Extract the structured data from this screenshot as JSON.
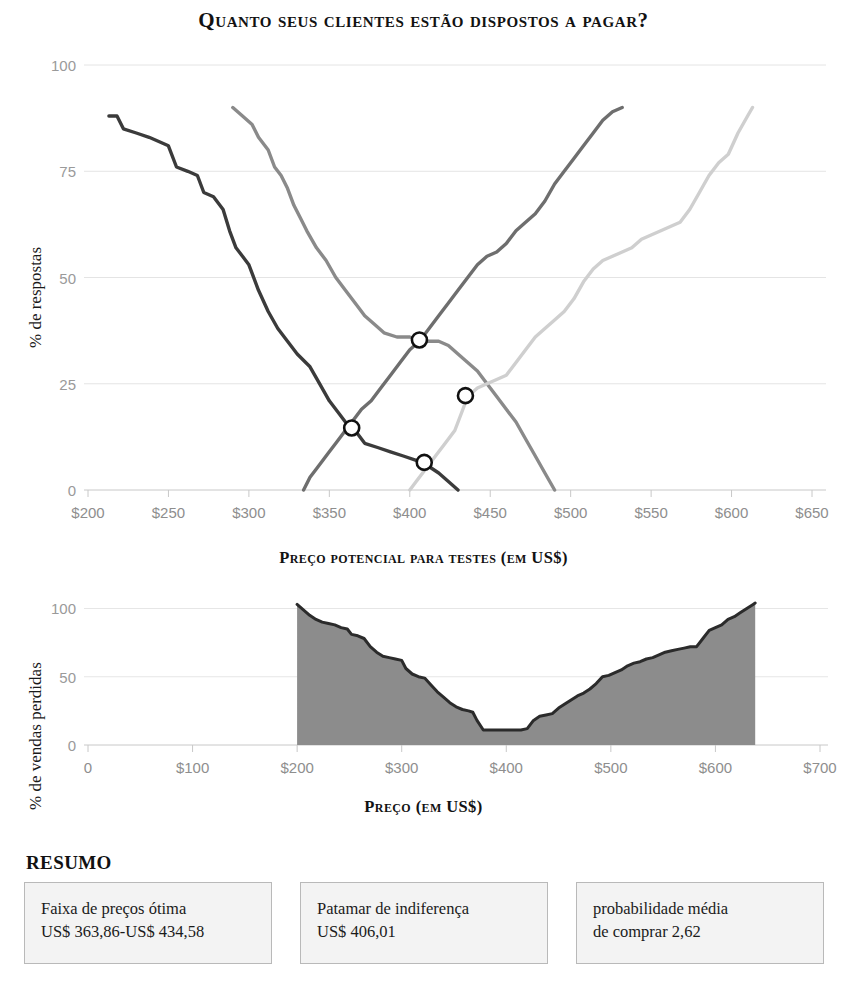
{
  "title": "Quanto seus clientes estão dispostos a pagar?",
  "chart_data": [
    {
      "type": "line",
      "title": "Quanto seus clientes estão dispostos a pagar?",
      "xlabel": "Preço potencial para testes (em US$)",
      "ylabel": "% de respostas",
      "xlim": [
        200,
        650
      ],
      "ylim": [
        0,
        100
      ],
      "xticks": [
        "$200",
        "$250",
        "$300",
        "$350",
        "$400",
        "$450",
        "$500",
        "$550",
        "$600",
        "$650"
      ],
      "xtick_values": [
        200,
        250,
        300,
        350,
        400,
        450,
        500,
        550,
        600,
        650
      ],
      "yticks": [
        "0",
        "25",
        "50",
        "75",
        "100"
      ],
      "ytick_values": [
        0,
        25,
        50,
        75,
        100
      ],
      "grid": true,
      "legend": "none",
      "series": [
        {
          "name": "muito barato (acumulado decrescente)",
          "color": "#3b3b3b",
          "points": [
            [
              213,
              88
            ],
            [
              218,
              88
            ],
            [
              222,
              85
            ],
            [
              230,
              84
            ],
            [
              238,
              83
            ],
            [
              244,
              82
            ],
            [
              250,
              81
            ],
            [
              255,
              76
            ],
            [
              262,
              75
            ],
            [
              268,
              74
            ],
            [
              272,
              70
            ],
            [
              278,
              69
            ],
            [
              284,
              66
            ],
            [
              288,
              61
            ],
            [
              292,
              57
            ],
            [
              296,
              55
            ],
            [
              300,
              53
            ],
            [
              306,
              47
            ],
            [
              312,
              42
            ],
            [
              318,
              38
            ],
            [
              324,
              35
            ],
            [
              330,
              32
            ],
            [
              338,
              29
            ],
            [
              344,
              25
            ],
            [
              350,
              21
            ],
            [
              356,
              18
            ],
            [
              362,
              15
            ],
            [
              366,
              14
            ],
            [
              372,
              11
            ],
            [
              380,
              10
            ],
            [
              388,
              9
            ],
            [
              396,
              8
            ],
            [
              404,
              7
            ],
            [
              410,
              6
            ],
            [
              418,
              4
            ],
            [
              424,
              2
            ],
            [
              430,
              0
            ]
          ]
        },
        {
          "name": "barato (acumulado decrescente)",
          "color": "#8a8a8a",
          "points": [
            [
              290,
              90
            ],
            [
              296,
              88
            ],
            [
              302,
              86
            ],
            [
              306,
              83
            ],
            [
              312,
              80
            ],
            [
              316,
              76
            ],
            [
              320,
              74
            ],
            [
              324,
              71
            ],
            [
              328,
              67
            ],
            [
              332,
              64
            ],
            [
              336,
              61
            ],
            [
              342,
              57
            ],
            [
              348,
              54
            ],
            [
              354,
              50
            ],
            [
              360,
              47
            ],
            [
              366,
              44
            ],
            [
              372,
              41
            ],
            [
              378,
              39
            ],
            [
              384,
              37
            ],
            [
              392,
              36
            ],
            [
              400,
              36
            ],
            [
              408,
              35
            ],
            [
              412,
              35
            ],
            [
              418,
              35
            ],
            [
              424,
              34
            ],
            [
              430,
              32
            ],
            [
              436,
              30
            ],
            [
              442,
              28
            ],
            [
              448,
              25
            ],
            [
              454,
              22
            ],
            [
              460,
              19
            ],
            [
              466,
              16
            ],
            [
              472,
              12
            ],
            [
              478,
              8
            ],
            [
              484,
              4
            ],
            [
              490,
              0
            ]
          ]
        },
        {
          "name": "caro (acumulado crescente)",
          "color": "#6e6e6e",
          "points": [
            [
              334,
              0
            ],
            [
              338,
              3
            ],
            [
              342,
              5
            ],
            [
              346,
              7
            ],
            [
              350,
              9
            ],
            [
              354,
              11
            ],
            [
              358,
              13
            ],
            [
              362,
              15
            ],
            [
              366,
              17
            ],
            [
              370,
              19
            ],
            [
              376,
              21
            ],
            [
              382,
              24
            ],
            [
              388,
              27
            ],
            [
              394,
              30
            ],
            [
              400,
              33
            ],
            [
              406,
              35
            ],
            [
              412,
              38
            ],
            [
              418,
              41
            ],
            [
              424,
              44
            ],
            [
              430,
              47
            ],
            [
              436,
              50
            ],
            [
              442,
              53
            ],
            [
              448,
              55
            ],
            [
              454,
              56
            ],
            [
              460,
              58
            ],
            [
              466,
              61
            ],
            [
              472,
              63
            ],
            [
              478,
              65
            ],
            [
              484,
              68
            ],
            [
              490,
              72
            ],
            [
              496,
              75
            ],
            [
              502,
              78
            ],
            [
              508,
              81
            ],
            [
              514,
              84
            ],
            [
              520,
              87
            ],
            [
              526,
              89
            ],
            [
              532,
              90
            ]
          ]
        },
        {
          "name": "muito caro (acumulado crescente)",
          "color": "#cfcfcf",
          "points": [
            [
              400,
              0
            ],
            [
              404,
              2
            ],
            [
              410,
              5
            ],
            [
              416,
              8
            ],
            [
              422,
              11
            ],
            [
              428,
              14
            ],
            [
              432,
              18
            ],
            [
              436,
              22
            ],
            [
              442,
              24
            ],
            [
              448,
              25
            ],
            [
              454,
              26
            ],
            [
              460,
              27
            ],
            [
              466,
              30
            ],
            [
              472,
              33
            ],
            [
              478,
              36
            ],
            [
              484,
              38
            ],
            [
              490,
              40
            ],
            [
              496,
              42
            ],
            [
              502,
              45
            ],
            [
              508,
              49
            ],
            [
              514,
              52
            ],
            [
              520,
              54
            ],
            [
              526,
              55
            ],
            [
              532,
              56
            ],
            [
              538,
              57
            ],
            [
              544,
              59
            ],
            [
              550,
              60
            ],
            [
              556,
              61
            ],
            [
              562,
              62
            ],
            [
              568,
              63
            ],
            [
              574,
              66
            ],
            [
              580,
              70
            ],
            [
              586,
              74
            ],
            [
              592,
              77
            ],
            [
              598,
              79
            ],
            [
              604,
              84
            ],
            [
              610,
              88
            ],
            [
              613,
              90
            ]
          ]
        }
      ],
      "intersections": [
        {
          "name": "ponto-marginal-barateza",
          "x": 363.9,
          "y": 14.6,
          "label": "US$ 363,86"
        },
        {
          "name": "ponto-de-indiferenca",
          "x": 406.0,
          "y": 35.3,
          "label": "US$ 406,01"
        },
        {
          "name": "ponto-otimo",
          "x": 409.0,
          "y": 6.5,
          "label": "ponto ótimo"
        },
        {
          "name": "ponto-marginal-custo",
          "x": 434.6,
          "y": 22.2,
          "label": "US$ 434,58"
        }
      ]
    },
    {
      "type": "area",
      "xlabel": "Preço (em US$)",
      "ylabel": "% de vendas perdidas",
      "xlim": [
        0,
        700
      ],
      "ylim": [
        0,
        115
      ],
      "xticks": [
        "0",
        "$100",
        "$200",
        "$300",
        "$400",
        "$500",
        "$600",
        "$700"
      ],
      "xtick_values": [
        0,
        100,
        200,
        300,
        400,
        500,
        600,
        700
      ],
      "yticks": [
        "0",
        "50",
        "100"
      ],
      "ytick_values": [
        0,
        50,
        100
      ],
      "grid": true,
      "fill_color": "#8c8c8c",
      "line_color": "#2b2b2b",
      "points": [
        [
          200,
          103
        ],
        [
          206,
          99
        ],
        [
          212,
          95
        ],
        [
          218,
          92
        ],
        [
          224,
          90
        ],
        [
          230,
          89
        ],
        [
          236,
          88
        ],
        [
          242,
          86
        ],
        [
          248,
          85
        ],
        [
          252,
          81
        ],
        [
          258,
          80
        ],
        [
          264,
          78
        ],
        [
          270,
          72
        ],
        [
          276,
          68
        ],
        [
          282,
          65
        ],
        [
          288,
          64
        ],
        [
          294,
          63
        ],
        [
          300,
          62
        ],
        [
          304,
          56
        ],
        [
          310,
          52
        ],
        [
          316,
          50
        ],
        [
          322,
          49
        ],
        [
          328,
          44
        ],
        [
          334,
          39
        ],
        [
          340,
          35
        ],
        [
          346,
          31
        ],
        [
          352,
          28
        ],
        [
          358,
          26
        ],
        [
          364,
          25
        ],
        [
          368,
          24
        ],
        [
          372,
          18
        ],
        [
          378,
          11
        ],
        [
          384,
          11
        ],
        [
          392,
          11
        ],
        [
          400,
          11
        ],
        [
          408,
          11
        ],
        [
          414,
          11
        ],
        [
          420,
          12
        ],
        [
          426,
          18
        ],
        [
          432,
          21
        ],
        [
          438,
          22
        ],
        [
          444,
          23
        ],
        [
          450,
          27
        ],
        [
          456,
          30
        ],
        [
          462,
          33
        ],
        [
          468,
          36
        ],
        [
          474,
          38
        ],
        [
          480,
          41
        ],
        [
          486,
          45
        ],
        [
          492,
          50
        ],
        [
          498,
          51
        ],
        [
          504,
          53
        ],
        [
          510,
          55
        ],
        [
          516,
          58
        ],
        [
          522,
          60
        ],
        [
          528,
          61
        ],
        [
          534,
          63
        ],
        [
          540,
          64
        ],
        [
          546,
          66
        ],
        [
          552,
          68
        ],
        [
          558,
          69
        ],
        [
          564,
          70
        ],
        [
          570,
          71
        ],
        [
          576,
          72
        ],
        [
          582,
          72
        ],
        [
          588,
          78
        ],
        [
          594,
          84
        ],
        [
          600,
          86
        ],
        [
          606,
          88
        ],
        [
          612,
          92
        ],
        [
          618,
          94
        ],
        [
          624,
          97
        ],
        [
          630,
          100
        ],
        [
          636,
          103
        ],
        [
          638,
          104
        ]
      ]
    }
  ],
  "summary": {
    "heading": "RESUMO",
    "boxes": [
      {
        "name": "faixa-de-precos-otima",
        "line1": "Faixa de preços ótima",
        "line2": "US$ 363,86-US$ 434,58"
      },
      {
        "name": "patamar-de-indiferenca",
        "line1": "Patamar de indiferença",
        "line2": "US$ 406,01"
      },
      {
        "name": "probabilidade-media",
        "line1": "probabilidade média",
        "line2": "de comprar 2,62"
      }
    ]
  }
}
